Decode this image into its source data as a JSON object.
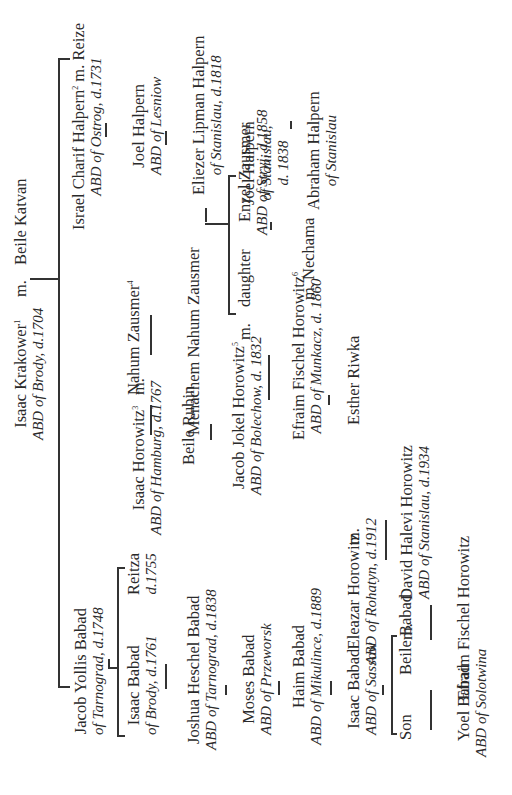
{
  "diagram": {
    "type": "family-tree",
    "orientation": "rotated-90-ccw",
    "marriage_label": "m.",
    "root": {
      "name": "Isaac Krakower",
      "note": "1",
      "title": "ABD of Brody, d.1704",
      "spouse": "Beile Katvan"
    },
    "branch_babad": {
      "jacob": {
        "name": "Jacob Yollis Babad",
        "title": "of Tarnograd, d.1748"
      },
      "isaac": {
        "name": "Isaac Babad",
        "title": "of Brody, d.1761"
      },
      "reitza": {
        "name": "Reitza",
        "title": "d.1755"
      },
      "joshua": {
        "name": "Joshua Heschel Babad",
        "title": "ABD of Tarnograd, d.1838"
      },
      "moses": {
        "name": "Moses Babad",
        "title": "ABD of Przeworsk"
      },
      "haim": {
        "name": "Haim Babad",
        "title": "ABD of Mikulince, d.1889"
      },
      "isaac2": {
        "name": "Isaac Babad",
        "title": "ABD of Sassow"
      },
      "son": {
        "name": "Son"
      },
      "beile_babad": {
        "name": "Beile Babad"
      },
      "yoel": {
        "name": "Yoel Babad",
        "title": "ABD of Solotwina"
      },
      "efraim2": {
        "name": "Efraim Fischel Horowitz"
      }
    },
    "branch_horowitz": {
      "isaac_h": {
        "name": "Isaac Horowitz",
        "note": "3",
        "title": "ABD of Hamburg, d.1767"
      },
      "beile_rubin": {
        "name": "Beile Rubin"
      },
      "jacob_jokel": {
        "name": "Jacob Jokel Horowitz",
        "note": "5",
        "title": "ABD of Bolechow, d. 1832"
      },
      "efraim": {
        "name": "Efraim Fischel Horowitz",
        "note": "6",
        "title": "ABD of Munkacz, d. 1860"
      },
      "esther": {
        "name": "Esther Riwka"
      },
      "eleazar": {
        "name": "Eleazar Horowitz",
        "title": "ABD of Rohatyn, d.1912"
      },
      "david": {
        "name": "David Halevi Horowitz",
        "title": "ABD of Stanislau, d.1934"
      }
    },
    "branch_zausmer": {
      "nahum": {
        "name": "Nahum Zausmer",
        "note": "4"
      },
      "menachem": {
        "name": "Menachem Nahum Zausmer"
      },
      "daughter": {
        "name": "daughter"
      },
      "enzel": {
        "name": "Enzel Zausmer",
        "title": "ABD of Stryj, d.1858"
      },
      "nechama": {
        "name": "Nechama"
      }
    },
    "branch_halpern": {
      "israel": {
        "name": "Israel Charif Halpern",
        "note": "2",
        "title": "ABD of Ostrog, d.1731",
        "spouse": "Reize"
      },
      "joel": {
        "name": "Joel Halpern",
        "title": "ABD of Lesniow"
      },
      "eliezer": {
        "name": "Eliezer Lipman Halpern",
        "title": "of Stanislau, d.1818"
      },
      "joel2": {
        "name": "Joel Halpern",
        "title1": "of Stanislau,",
        "title2": "d. 1838"
      },
      "abraham": {
        "name": "Abraham Halpern",
        "title": "of Stanislau"
      }
    }
  }
}
